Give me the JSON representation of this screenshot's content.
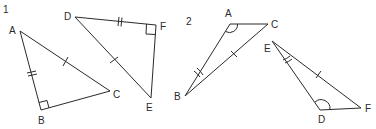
{
  "figures": [
    {
      "number": "1",
      "triangles": [
        {
          "name": "ABC",
          "vertices": {
            "A": {
              "label": "A",
              "x": 20,
              "y": 31
            },
            "B": {
              "label": "B",
              "x": 41,
              "y": 110
            },
            "C": {
              "label": "C",
              "x": 110,
              "y": 91
            }
          },
          "right_angle_at": "B",
          "marks": {
            "AB": "double-tick",
            "AC": "single-tick"
          }
        },
        {
          "name": "DEF",
          "vertices": {
            "D": {
              "label": "D",
              "x": 75,
              "y": 17
            },
            "E": {
              "label": "E",
              "x": 151,
              "y": 98
            },
            "F": {
              "label": "F",
              "x": 156,
              "y": 25
            }
          },
          "right_angle_at": "F",
          "marks": {
            "DF": "double-tick",
            "DE": "single-tick"
          }
        }
      ]
    },
    {
      "number": "2",
      "triangles": [
        {
          "name": "ABC",
          "vertices": {
            "A": {
              "label": "A",
              "x": 230,
              "y": 24
            },
            "B": {
              "label": "B",
              "x": 185,
              "y": 96
            },
            "C": {
              "label": "C",
              "x": 268,
              "y": 24
            }
          },
          "angle_marks": {
            "A": "single-arc",
            "B": "double-arc"
          },
          "marks": {
            "BC": "single-tick"
          }
        },
        {
          "name": "DEF",
          "vertices": {
            "D": {
              "label": "D",
              "x": 320,
              "y": 110
            },
            "E": {
              "label": "E",
              "x": 272,
              "y": 41
            },
            "F": {
              "label": "F",
              "x": 361,
              "y": 108
            }
          },
          "angle_marks": {
            "D": "single-arc",
            "E": "double-arc"
          },
          "marks": {
            "EF": "single-tick"
          }
        }
      ]
    }
  ]
}
